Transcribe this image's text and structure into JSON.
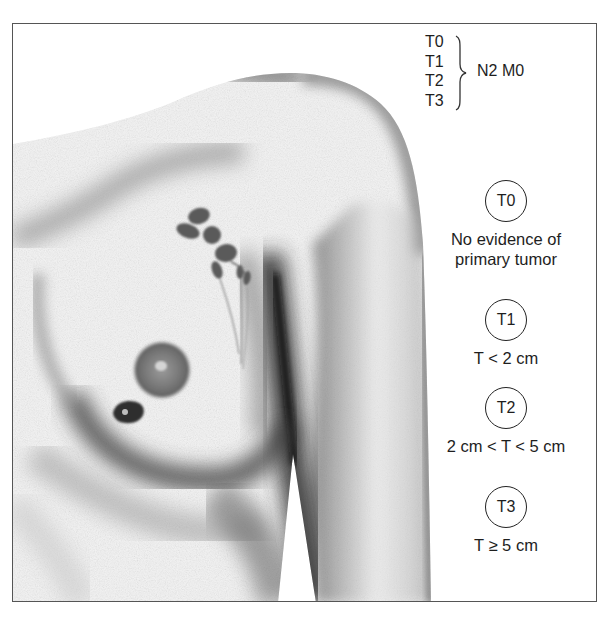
{
  "figure": {
    "type": "medical-illustration",
    "colors": {
      "frame": "#555555",
      "ink": "#1e1e1e",
      "background": "#ffffff"
    }
  },
  "legend": {
    "t_list": [
      "T0",
      "T1",
      "T2",
      "T3"
    ],
    "grouping_label": "N2 M0",
    "stages": [
      {
        "label": "T0",
        "description_lines": [
          "No evidence of",
          "primary tumor"
        ]
      },
      {
        "label": "T1",
        "description_lines": [
          "T < 2 cm"
        ]
      },
      {
        "label": "T2",
        "description_lines": [
          "2 cm < T < 5 cm"
        ]
      },
      {
        "label": "T3",
        "description_lines": [
          "T ≥ 5 cm"
        ]
      }
    ]
  }
}
